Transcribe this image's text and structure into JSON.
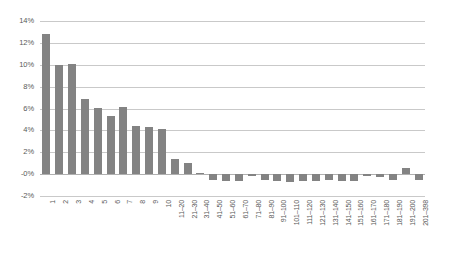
{
  "chart_data": {
    "type": "bar",
    "title": "",
    "subtitle": "",
    "xlabel": "",
    "ylabel": "",
    "ylim": [
      -2,
      14
    ],
    "ytick_labels": [
      "14%",
      "12%",
      "10%",
      "8%",
      "6%",
      "4%",
      "2%",
      "-0%",
      "-2%"
    ],
    "ytick_values": [
      14,
      12,
      10,
      8,
      6,
      4,
      2,
      0,
      -2
    ],
    "grid": true,
    "legend": "none",
    "categories": [
      "1",
      "2",
      "3",
      "4",
      "5",
      "6",
      "7",
      "8",
      "9",
      "10",
      "11–20",
      "21–30",
      "31–40",
      "41–50",
      "51–60",
      "61–70",
      "71–80",
      "81–90",
      "91–100",
      "101–110",
      "111–120",
      "121–130",
      "131–140",
      "141–150",
      "151–160",
      "161–170",
      "171–180",
      "181–190",
      "191–200",
      "201–398"
    ],
    "values": [
      12.8,
      10.0,
      10.05,
      6.9,
      6.05,
      5.35,
      6.1,
      4.4,
      4.35,
      4.15,
      1.4,
      1.05,
      0.1,
      -0.55,
      -0.65,
      -0.6,
      -0.2,
      -0.55,
      -0.65,
      -0.7,
      -0.6,
      -0.6,
      -0.55,
      -0.6,
      -0.6,
      -0.2,
      -0.25,
      -0.5,
      0.55,
      -0.55
    ],
    "series": [
      {
        "name": "",
        "color": "#838383",
        "values": [
          12.8,
          10.0,
          10.05,
          6.9,
          6.05,
          5.35,
          6.1,
          4.4,
          4.35,
          4.15,
          1.4,
          1.05,
          0.1,
          -0.55,
          -0.65,
          -0.6,
          -0.2,
          -0.55,
          -0.65,
          -0.7,
          -0.6,
          -0.6,
          -0.55,
          -0.6,
          -0.6,
          -0.2,
          -0.25,
          -0.5,
          0.55,
          -0.55
        ]
      }
    ],
    "colors": {
      "bar": "#838383",
      "gridline": "#c9c9c9",
      "zero_line": "#b0b0b0",
      "tick_text": "#595959",
      "background": "#ffffff"
    }
  }
}
